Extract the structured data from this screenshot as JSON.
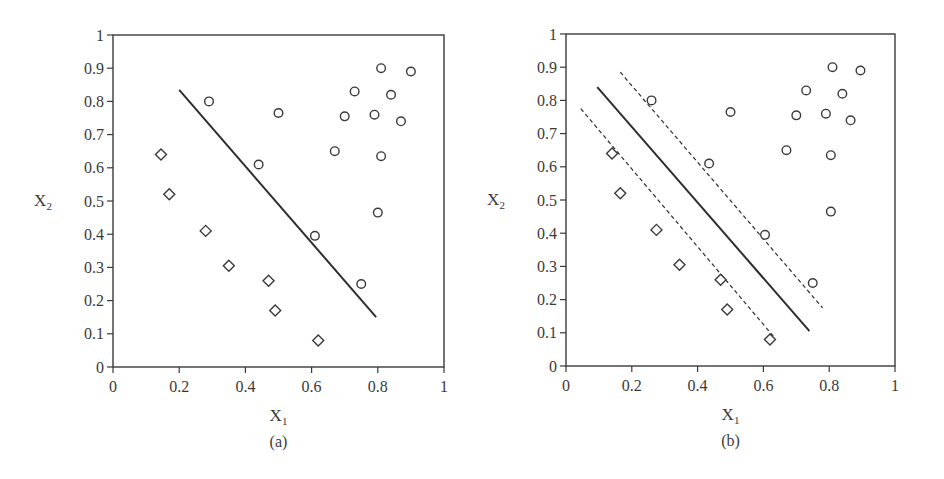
{
  "chart_data": [
    {
      "type": "scatter",
      "panel": "a",
      "caption": "(a)",
      "title": "",
      "xlabel": "X",
      "xlabel_sub": "1",
      "ylabel": "X",
      "ylabel_sub": "2",
      "xlim": [
        0,
        1
      ],
      "ylim": [
        0,
        1
      ],
      "xticks": [
        "0",
        "0.2",
        "0.4",
        "0.6",
        "0.8",
        "1"
      ],
      "yticks": [
        "0",
        "0.1",
        "0.2",
        "0.3",
        "0.4",
        "0.5",
        "0.6",
        "0.7",
        "0.8",
        "0.9",
        "1"
      ],
      "grid": false,
      "legend": null,
      "series": [
        {
          "name": "circles",
          "marker": "circle",
          "points": [
            [
              0.29,
              0.8
            ],
            [
              0.5,
              0.765
            ],
            [
              0.44,
              0.61
            ],
            [
              0.61,
              0.395
            ],
            [
              0.75,
              0.25
            ],
            [
              0.67,
              0.65
            ],
            [
              0.7,
              0.755
            ],
            [
              0.73,
              0.83
            ],
            [
              0.79,
              0.76
            ],
            [
              0.81,
              0.9
            ],
            [
              0.84,
              0.82
            ],
            [
              0.87,
              0.74
            ],
            [
              0.9,
              0.89
            ],
            [
              0.81,
              0.635
            ],
            [
              0.8,
              0.465
            ]
          ]
        },
        {
          "name": "diamonds",
          "marker": "diamond",
          "points": [
            [
              0.145,
              0.64
            ],
            [
              0.17,
              0.52
            ],
            [
              0.28,
              0.41
            ],
            [
              0.35,
              0.305
            ],
            [
              0.47,
              0.26
            ],
            [
              0.49,
              0.17
            ],
            [
              0.62,
              0.08
            ]
          ]
        }
      ],
      "lines": [
        {
          "name": "separating-line",
          "style": "solid",
          "from": [
            0.2,
            0.835
          ],
          "to": [
            0.795,
            0.15
          ]
        }
      ]
    },
    {
      "type": "scatter",
      "panel": "b",
      "caption": "(b)",
      "title": "",
      "xlabel": "X",
      "xlabel_sub": "1",
      "ylabel": "X",
      "ylabel_sub": "2",
      "xlim": [
        0,
        1
      ],
      "ylim": [
        0,
        1
      ],
      "xticks": [
        "0",
        "0.2",
        "0.4",
        "0.6",
        "0.8",
        "1"
      ],
      "yticks": [
        "0",
        "0.1",
        "0.2",
        "0.3",
        "0.4",
        "0.5",
        "0.6",
        "0.7",
        "0.8",
        "0.9",
        "1"
      ],
      "grid": false,
      "legend": null,
      "series": [
        {
          "name": "circles",
          "marker": "circle",
          "points": [
            [
              0.26,
              0.8
            ],
            [
              0.5,
              0.765
            ],
            [
              0.435,
              0.61
            ],
            [
              0.605,
              0.395
            ],
            [
              0.75,
              0.25
            ],
            [
              0.67,
              0.65
            ],
            [
              0.7,
              0.755
            ],
            [
              0.73,
              0.83
            ],
            [
              0.79,
              0.76
            ],
            [
              0.81,
              0.9
            ],
            [
              0.84,
              0.82
            ],
            [
              0.865,
              0.74
            ],
            [
              0.895,
              0.89
            ],
            [
              0.805,
              0.635
            ],
            [
              0.805,
              0.465
            ]
          ]
        },
        {
          "name": "diamonds",
          "marker": "diamond",
          "points": [
            [
              0.14,
              0.64
            ],
            [
              0.165,
              0.52
            ],
            [
              0.275,
              0.41
            ],
            [
              0.345,
              0.305
            ],
            [
              0.47,
              0.26
            ],
            [
              0.49,
              0.17
            ],
            [
              0.62,
              0.08
            ]
          ]
        }
      ],
      "lines": [
        {
          "name": "separating-hyperplane",
          "style": "solid",
          "from": [
            0.095,
            0.84
          ],
          "to": [
            0.74,
            0.105
          ]
        },
        {
          "name": "upper-margin",
          "style": "dashed",
          "from": [
            0.165,
            0.885
          ],
          "to": [
            0.78,
            0.175
          ]
        },
        {
          "name": "lower-margin",
          "style": "dashed",
          "from": [
            0.045,
            0.775
          ],
          "to": [
            0.63,
            0.09
          ]
        }
      ]
    }
  ]
}
